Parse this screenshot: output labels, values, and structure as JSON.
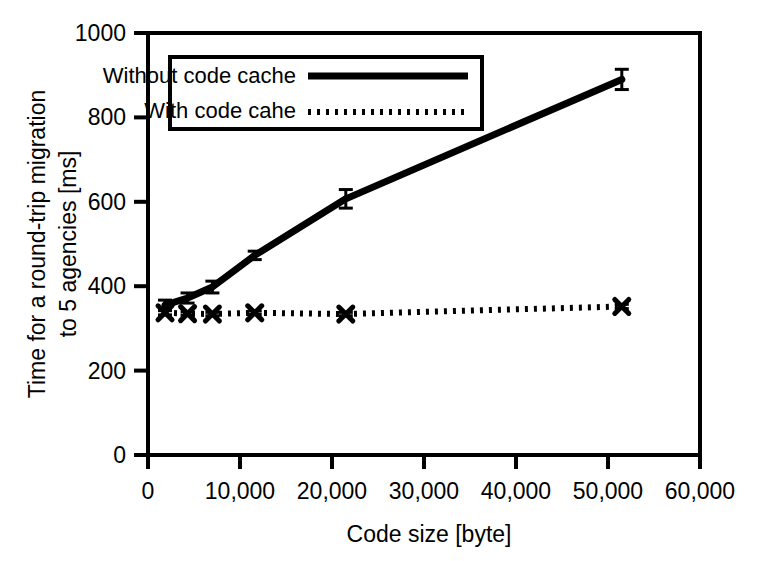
{
  "chart_data": {
    "type": "line",
    "title": "",
    "subtitle": "",
    "xlabel": "Code size [byte]",
    "ylabel": "Time for a round-trip migration to 5 agencies [ms]",
    "ylabel_line1": "Time for a round-trip migration",
    "ylabel_line2": "to 5 agencies [ms]",
    "xlim": [
      0,
      60000
    ],
    "ylim": [
      0,
      1000
    ],
    "xticks": [
      0,
      10000,
      20000,
      30000,
      40000,
      50000,
      60000
    ],
    "xticklabels": [
      "0",
      "10,000",
      "20,000",
      "30,000",
      "40,000",
      "50,000",
      "60,000"
    ],
    "yticks": [
      0,
      200,
      400,
      600,
      800,
      1000
    ],
    "yticklabels": [
      "0",
      "200",
      "400",
      "600",
      "800",
      "1000"
    ],
    "grid": false,
    "legend_position": "upper-left-inside",
    "x": [
      1850,
      4300,
      7000,
      11600,
      21500,
      51500
    ],
    "series": [
      {
        "name": "Without code cache",
        "style": "solid",
        "marker": "none",
        "color": "#000000",
        "values": [
          355,
          372,
          398,
          473,
          607,
          890
        ],
        "errors": [
          12,
          12,
          14,
          10,
          22,
          24
        ]
      },
      {
        "name": "With code cahe",
        "style": "dotted",
        "marker": "x",
        "color": "#000000",
        "values": [
          337,
          335,
          334,
          337,
          334,
          352
        ],
        "errors": [
          5,
          4,
          4,
          4,
          4,
          5
        ]
      }
    ],
    "legend": [
      {
        "label": "Without code cache",
        "style": "solid"
      },
      {
        "label": "With code cahe",
        "style": "dotted"
      }
    ]
  },
  "figure": {
    "background_color": "#ffffff",
    "axis_color": "#000000"
  }
}
